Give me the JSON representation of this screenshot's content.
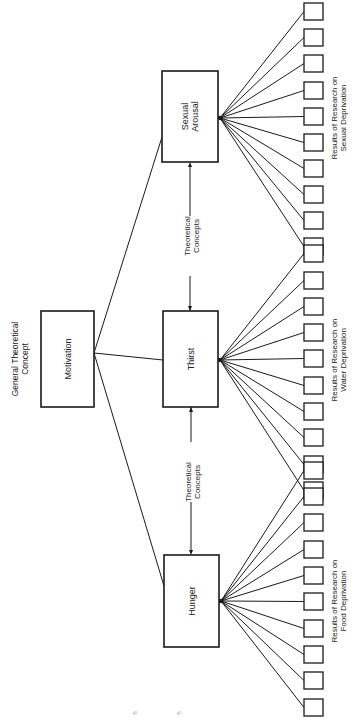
{
  "diagram": {
    "orientation": "rotated-90-ccw",
    "colors": {
      "stroke": "#1a1a1a",
      "text": "#222222",
      "background": "#ffffff"
    },
    "general_concept": {
      "caption_line1": "General Theoretical",
      "caption_line2": "Concept",
      "label": "Motivation",
      "box": {
        "x": 41,
        "y": 311,
        "w": 53,
        "h": 96
      }
    },
    "concepts": [
      {
        "id": "sexual-arousal",
        "line1": "Sexual",
        "line2": "Arousal",
        "box": {
          "x": 162,
          "y": 71,
          "w": 56,
          "h": 91
        },
        "fan_y": 118,
        "link_y": 137
      },
      {
        "id": "thirst",
        "line1": "Thirst",
        "line2": "",
        "box": {
          "x": 163,
          "y": 311,
          "w": 55,
          "h": 96
        },
        "fan_y": 360,
        "link_y": 360
      },
      {
        "id": "hunger",
        "line1": "Hunger",
        "line2": "",
        "box": {
          "x": 164,
          "y": 555,
          "w": 55,
          "h": 92
        },
        "fan_y": 601,
        "link_y": 586
      }
    ],
    "theoretical_links": [
      {
        "line1": "Theoretical",
        "line2": "Concepts",
        "x": 190,
        "y_from": 311,
        "y_to": 162,
        "label_y": 236
      },
      {
        "line1": "Theoretical",
        "line2": "Concepts",
        "x": 191,
        "y_from": 407,
        "y_to": 555,
        "label_y": 482
      }
    ],
    "result_groups": [
      {
        "concept": "sexual-arousal",
        "line1": "Results of Research on",
        "line2": "Sexual Deprivation",
        "label_y": 118,
        "box_x": 304,
        "box_w": 19,
        "box_h": 17,
        "box_ys": [
          3,
          29,
          55,
          82,
          108,
          134,
          160,
          186,
          212,
          238
        ]
      },
      {
        "concept": "thirst",
        "line1": "Results of Research on",
        "line2": "Water Deprivation",
        "label_y": 360,
        "box_x": 304,
        "box_w": 19,
        "box_h": 17,
        "box_ys": [
          245,
          272,
          298,
          324,
          350,
          377,
          403,
          429,
          456,
          482
        ]
      },
      {
        "concept": "hunger",
        "line1": "Results of Research on",
        "line2": "Food Deprivation",
        "label_y": 601,
        "box_x": 304,
        "box_w": 19,
        "box_h": 17,
        "box_ys": [
          462,
          488,
          514,
          541,
          567,
          593,
          620,
          646,
          672,
          699
        ]
      }
    ]
  }
}
